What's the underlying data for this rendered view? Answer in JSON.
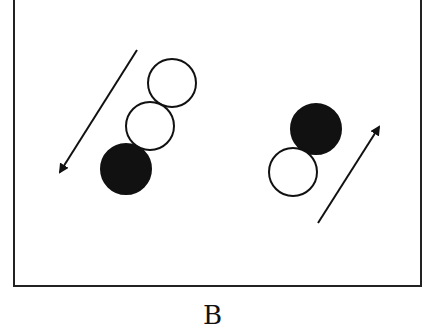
{
  "figure": {
    "panel_label": "B",
    "colors": {
      "ink": "#111111",
      "background": "#ffffff",
      "filled": "#111111",
      "hollow": "#ffffff"
    },
    "groups": [
      {
        "name": "left-chain",
        "balls": [
          {
            "fill": "hollow",
            "cx": 172,
            "cy": 83,
            "r": 24
          },
          {
            "fill": "hollow",
            "cx": 150,
            "cy": 126,
            "r": 24
          },
          {
            "fill": "filled",
            "cx": 126,
            "cy": 169,
            "r": 25
          }
        ],
        "arrow": {
          "direction": "down-left",
          "x1": 137,
          "y1": 50,
          "x2": 60,
          "y2": 172
        }
      },
      {
        "name": "right-pair",
        "balls": [
          {
            "fill": "filled",
            "cx": 316,
            "cy": 129,
            "r": 25
          },
          {
            "fill": "hollow",
            "cx": 293,
            "cy": 172,
            "r": 24
          }
        ],
        "arrow": {
          "direction": "up-right",
          "x1": 318,
          "y1": 223,
          "x2": 379,
          "y2": 127
        }
      }
    ]
  }
}
